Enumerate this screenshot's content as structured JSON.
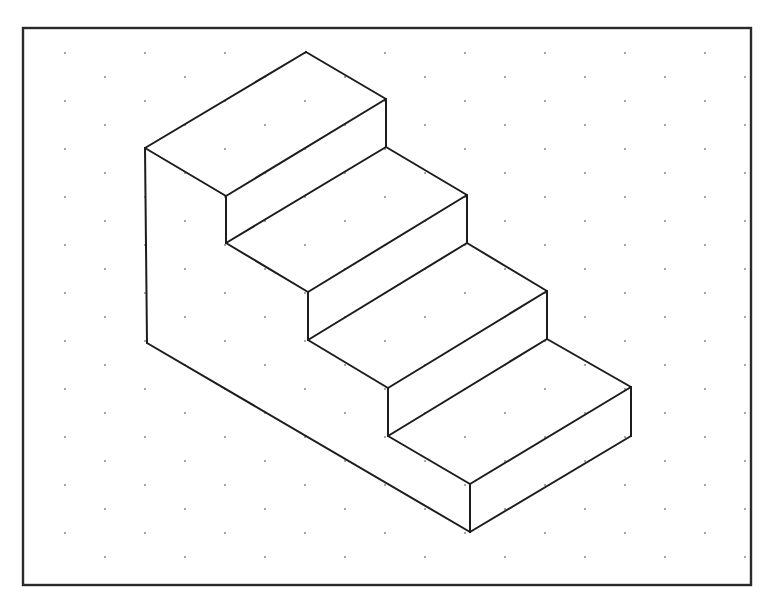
{
  "diagram": {
    "title": "",
    "colors": {
      "background": "#ffffff",
      "line": "#1c1c1c",
      "frame": "#2a2a2a",
      "grid_dot": "#8a8a8a"
    },
    "frame": {
      "x": 23,
      "y": 28,
      "width": 728,
      "height": 557
    },
    "dot_grid": {
      "type": "isometric",
      "origin_x": 65,
      "origin_y": 53,
      "dx": 80,
      "row_dy": 24,
      "row_offset": 40,
      "x_min": 30,
      "x_max": 745,
      "y_min": 40,
      "y_max": 580
    },
    "staircase": {
      "steps": 4,
      "vertices": {
        "back_left_top": [
          145,
          148
        ],
        "back_left_bottom": [
          147,
          343
        ],
        "apex": [
          306,
          52
        ],
        "s1_right_top": [
          386,
          99
        ],
        "s1_right_bottom": [
          386,
          147
        ],
        "s1_left_top": [
          226,
          196
        ],
        "s1_left_bottom": [
          226,
          243
        ],
        "s2_right_top": [
          467,
          195
        ],
        "s2_right_bottom": [
          467,
          243
        ],
        "s2_left_top": [
          308,
          292
        ],
        "s2_left_bottom": [
          308,
          340
        ],
        "s3_right_top": [
          547,
          291
        ],
        "s3_right_bottom": [
          547,
          339
        ],
        "s3_left_top": [
          388,
          388
        ],
        "s3_left_bottom": [
          388,
          436
        ],
        "s4_right_top": [
          631,
          387
        ],
        "s4_right_bottom": [
          631,
          436
        ],
        "s4_left_top": [
          470,
          484
        ],
        "s4_left_bottom": [
          470,
          532
        ]
      },
      "edges": [
        [
          "back_left_top",
          "apex"
        ],
        [
          "apex",
          "s1_right_top"
        ],
        [
          "back_left_top",
          "s1_left_top"
        ],
        [
          "s1_left_top",
          "s1_right_top"
        ],
        [
          "back_left_top",
          "back_left_bottom"
        ],
        [
          "s1_right_top",
          "s1_right_bottom"
        ],
        [
          "s1_left_top",
          "s1_left_bottom"
        ],
        [
          "s1_left_bottom",
          "s1_right_bottom"
        ],
        [
          "s1_right_bottom",
          "s2_right_top"
        ],
        [
          "s1_left_bottom",
          "s2_left_top"
        ],
        [
          "s2_left_top",
          "s2_right_top"
        ],
        [
          "s2_right_top",
          "s2_right_bottom"
        ],
        [
          "s2_left_top",
          "s2_left_bottom"
        ],
        [
          "s2_left_bottom",
          "s2_right_bottom"
        ],
        [
          "s2_right_bottom",
          "s3_right_top"
        ],
        [
          "s2_left_bottom",
          "s3_left_top"
        ],
        [
          "s3_left_top",
          "s3_right_top"
        ],
        [
          "s3_right_top",
          "s3_right_bottom"
        ],
        [
          "s3_left_top",
          "s3_left_bottom"
        ],
        [
          "s3_left_bottom",
          "s3_right_bottom"
        ],
        [
          "s3_right_bottom",
          "s4_right_top"
        ],
        [
          "s3_left_bottom",
          "s4_left_top"
        ],
        [
          "s4_left_top",
          "s4_right_top"
        ],
        [
          "s4_right_top",
          "s4_right_bottom"
        ],
        [
          "s4_left_top",
          "s4_left_bottom"
        ],
        [
          "s4_left_bottom",
          "s4_right_bottom"
        ],
        [
          "back_left_bottom",
          "s4_left_bottom"
        ]
      ]
    }
  }
}
